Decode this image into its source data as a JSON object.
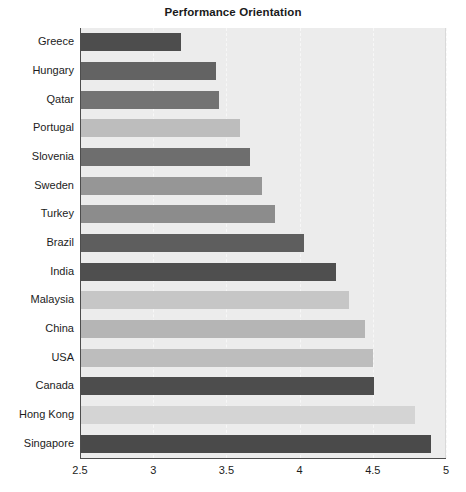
{
  "chart_data": {
    "type": "bar",
    "orientation": "horizontal",
    "title": "Performance Orientation",
    "xlabel": "",
    "ylabel": "",
    "xlim": [
      2.5,
      5
    ],
    "ylim": null,
    "grid": true,
    "legend": null,
    "xticks": [
      "2.5",
      "3",
      "3.5",
      "4",
      "4.5",
      "5"
    ],
    "xtick_values": [
      2.5,
      3,
      3.5,
      4,
      4.5,
      5
    ],
    "categories": [
      "Greece",
      "Hungary",
      "Qatar",
      "Portugal",
      "Slovenia",
      "Sweden",
      "Turkey",
      "Brazil",
      "India",
      "Malaysia",
      "China",
      "USA",
      "Canada",
      "Hong Kong",
      "Singapore"
    ],
    "values": [
      3.19,
      3.43,
      3.45,
      3.59,
      3.66,
      3.74,
      3.83,
      4.03,
      4.25,
      4.34,
      4.45,
      4.5,
      4.51,
      4.79,
      4.9
    ],
    "bar_colors": [
      "#4d4d4d",
      "#636363",
      "#737373",
      "#bdbdbd",
      "#6e6e6e",
      "#969696",
      "#8c8c8c",
      "#5e5e5e",
      "#4f4f4f",
      "#c6c6c6",
      "#b5b5b5",
      "#bdbdbd",
      "#4d4d4d",
      "#d4d4d4",
      "#4a4a4a"
    ]
  },
  "colors": {
    "plot_background": "#ececec",
    "page_background": "#ffffff",
    "axis": "#4d4d4d",
    "gridline": "#f7f7f7",
    "text": "#1c1c1c"
  }
}
